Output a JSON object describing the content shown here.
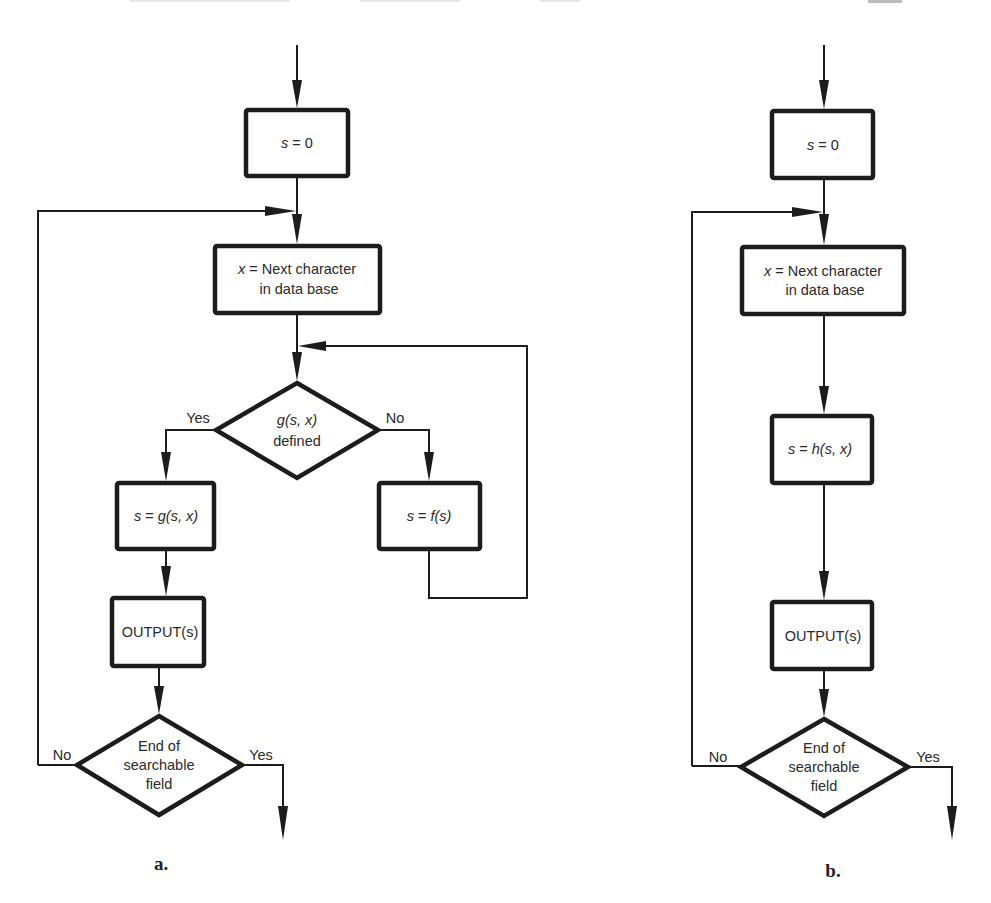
{
  "header": {
    "page_number_fragment": "125"
  },
  "diagram_a": {
    "caption": "a.",
    "start_box": {
      "var": "s",
      "rest": " = 0"
    },
    "next_char_box": {
      "var": "x",
      "line1_rest": " = Next character",
      "line2": "in data base"
    },
    "decision": {
      "fn": "g",
      "args": "(s, x)",
      "line2": "defined",
      "yes_label": "Yes",
      "no_label": "No"
    },
    "goto_box": {
      "lhs": "s",
      "eq": " = ",
      "fn": "g",
      "args": "(s, x)"
    },
    "fail_box": {
      "lhs": "s",
      "eq": " = ",
      "fn": "f",
      "args": "(s)"
    },
    "output_box": "OUTPUT(s)",
    "end_decision": {
      "line1": "End of",
      "line2": "searchable",
      "line3": "field",
      "yes_label": "Yes",
      "no_label": "No"
    }
  },
  "diagram_b": {
    "caption": "b.",
    "start_box": {
      "var": "s",
      "rest": " = 0"
    },
    "next_char_box": {
      "var": "x",
      "line1_rest": " = Next character",
      "line2": "in data base"
    },
    "transition_box": {
      "lhs": "s",
      "eq": " = ",
      "fn": "h",
      "args": "(s, x)"
    },
    "output_box": "OUTPUT(s)",
    "end_decision": {
      "line1": "End of",
      "line2": "searchable",
      "line3": "field",
      "yes_label": "Yes",
      "no_label": "No"
    }
  }
}
